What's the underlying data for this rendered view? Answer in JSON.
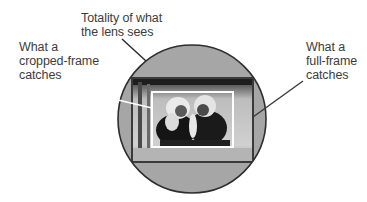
{
  "diagram": {
    "labels": {
      "totality": {
        "line1": "Totality of what",
        "line2": "the lens sees"
      },
      "cropped": {
        "line1": "What a",
        "line2": "cropped-frame",
        "line3": "catches"
      },
      "full": {
        "line1": "What a",
        "line2": "full-frame",
        "line3": "catches"
      }
    },
    "colors": {
      "circle_fill": "#a6a6a6",
      "circle_stroke": "#2e2e2e",
      "full_frame_stroke": "#3a3a3a",
      "crop_frame_stroke": "#ffffff",
      "text": "#3c3c3c"
    }
  }
}
